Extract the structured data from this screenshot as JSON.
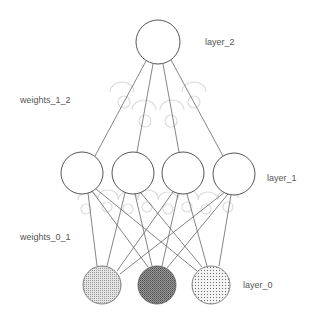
{
  "labels": {
    "layer_2": "layer_2",
    "weights_1_2": "weights_1_2",
    "layer_1": "layer_1",
    "weights_0_1": "weights_0_1",
    "layer_0": "layer_0"
  },
  "layers": {
    "layer_2": {
      "nodes": [
        {
          "x": 158,
          "y": 42
        }
      ],
      "r": 22
    },
    "layer_1": {
      "nodes": [
        {
          "x": 82,
          "y": 173
        },
        {
          "x": 133,
          "y": 173
        },
        {
          "x": 183,
          "y": 173
        },
        {
          "x": 234,
          "y": 174
        }
      ],
      "r": 21
    },
    "layer_0": {
      "nodes": [
        {
          "x": 102,
          "y": 285,
          "fill": "hatch-light"
        },
        {
          "x": 157,
          "y": 285,
          "fill": "hatch-dark"
        },
        {
          "x": 211,
          "y": 285,
          "fill": "dots"
        }
      ],
      "r": 19
    }
  },
  "colors": {
    "stroke": "#555555",
    "edge": "#666666",
    "knob": "#dddddd",
    "text": "#555555",
    "background": "#ffffff"
  }
}
